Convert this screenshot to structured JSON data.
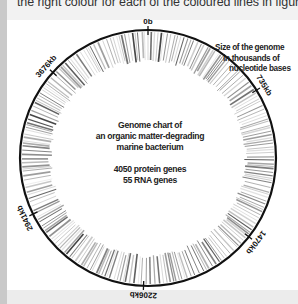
{
  "caption": "the right colour for each of the coloured lines in figure a.",
  "annotation": {
    "lines": [
      "Size of the genome",
      "in thousands of",
      "nucleotide bases"
    ]
  },
  "center": {
    "title_lines": [
      "Genome chart of",
      "an organic matter-degrading",
      "marine bacterium"
    ],
    "stats": [
      "4050 protein genes",
      "55 RNA genes"
    ]
  },
  "ring_labels": [
    {
      "text": "0b",
      "angle": 0
    },
    {
      "text": "735kb",
      "angle": 58
    },
    {
      "text": "1470kb",
      "angle": 128
    },
    {
      "text": "2206kb",
      "angle": 182
    },
    {
      "text": "2941kb",
      "angle": 244
    },
    {
      "text": "3676kb",
      "angle": 312
    }
  ],
  "colors": {
    "ring_outline": "#111111",
    "gene_bars": "#555555",
    "background": "#ffffff",
    "page": "#f2f2f2"
  }
}
